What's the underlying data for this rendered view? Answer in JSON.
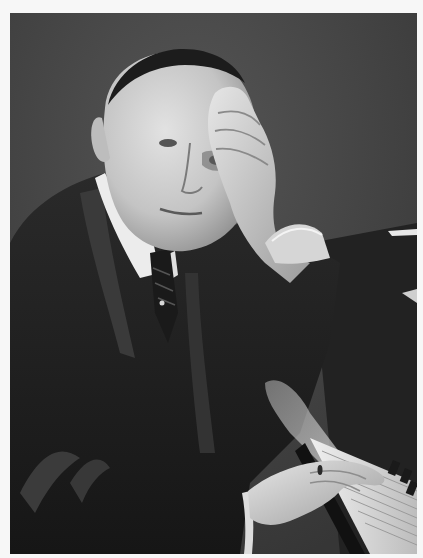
{
  "image": {
    "type": "photograph",
    "style": "black-and-white portrait",
    "alt": "Black-and-white portrait of a man in a dark suit with a white collar and striped tie, resting his head on his right hand with fingers pressed to his forehead, his left hand on piano keys in the lower right",
    "subject": {
      "description": "Man with closely cropped hair, dark suit, white high collar, dark tie with pin, left hand wearing a ring resting on piano keyboard",
      "pose": "right hand pressed against forehead, elbow resting on piano"
    },
    "elements": [
      "backdrop",
      "head",
      "raised-hand",
      "collar",
      "tie",
      "suit",
      "shirt-cuff",
      "resting-hand",
      "ring",
      "piano-keyboard"
    ]
  },
  "colors": {
    "background_page": "#f7f7f7",
    "backdrop": "#4a4a4a",
    "suit": "#1e1e1e",
    "skin_light": "#d8d8d8",
    "skin_shadow": "#9a9a9a",
    "collar": "#ececec",
    "keys": "#e4e4e4"
  }
}
